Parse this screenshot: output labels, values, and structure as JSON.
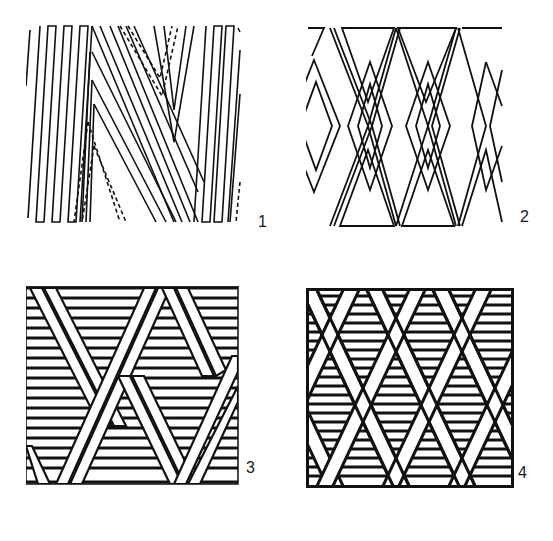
{
  "figure": {
    "ink_color": "#111111",
    "background_color": "#ffffff",
    "panels": [
      {
        "id": 1,
        "label": "1",
        "pattern": "zigzag-chevron-strands-with-dashed-underpasses"
      },
      {
        "id": 2,
        "label": "2",
        "pattern": "interlaced-diamond-outlines"
      },
      {
        "id": 3,
        "label": "3",
        "pattern": "diagonal-double-bands-over-horizontal-hatching"
      },
      {
        "id": 4,
        "label": "4",
        "pattern": "lattice-of-crossing-bands-with-hatched-diamonds"
      }
    ]
  }
}
